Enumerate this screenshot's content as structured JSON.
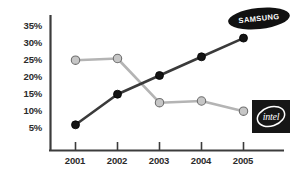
{
  "chart_data": {
    "type": "line",
    "title": "",
    "subtitle": "",
    "xlabel": "",
    "ylabel": "",
    "categories": [
      "2001",
      "2002",
      "2003",
      "2004",
      "2005"
    ],
    "x": [
      2001,
      2002,
      2003,
      2004,
      2005
    ],
    "ylim": [
      0,
      37
    ],
    "xlim": [
      2000.6,
      2005.4
    ],
    "grid": false,
    "legend_position": "inline-labels",
    "y_tick_labels": [
      "35%",
      "30%",
      "25%",
      "20%",
      "15%",
      "10%",
      "5%"
    ],
    "y_tick_values": [
      35,
      30,
      25,
      20,
      15,
      10,
      5
    ],
    "x_tick_labels": [
      "2001",
      "2002",
      "2003",
      "2004",
      "2005"
    ],
    "series": [
      {
        "name": "SAMSUNG",
        "color": "#3a3a3a",
        "marker": "filled-circle",
        "marker_color": "#141414",
        "values": [
          5.5,
          14.5,
          20.0,
          25.5,
          31.0
        ]
      },
      {
        "name": "intel",
        "color": "#b4b4b4",
        "marker": "open-circle",
        "marker_color": "#c6c6c6",
        "values": [
          24.5,
          25.0,
          12.0,
          12.5,
          9.5
        ]
      }
    ],
    "annotations": [
      {
        "name": "samsung-logo",
        "text": "SAMSUNG",
        "series": "SAMSUNG"
      },
      {
        "name": "intel-logo",
        "text": "intel",
        "series": "intel"
      }
    ]
  },
  "axes": {
    "axis_color": "#3c3c3c",
    "y_ticks": [
      {
        "label": "35%",
        "value": 35
      },
      {
        "label": "30%",
        "value": 30
      },
      {
        "label": "25%",
        "value": 25
      },
      {
        "label": "20%",
        "value": 20
      },
      {
        "label": "15%",
        "value": 15
      },
      {
        "label": "10%",
        "value": 10
      },
      {
        "label": "5%",
        "value": 5
      }
    ],
    "x_ticks": [
      {
        "label": "2001"
      },
      {
        "label": "2002"
      },
      {
        "label": "2003"
      },
      {
        "label": "2004"
      },
      {
        "label": "2005"
      }
    ]
  },
  "logos": {
    "samsung": {
      "text": "SAMSUNG",
      "bg": "#111111",
      "fg": "#ffffff"
    },
    "intel": {
      "text": "intel",
      "bg": "#161616",
      "fg": "#ffffff"
    }
  },
  "colors": {
    "background": "#ffffff",
    "samsung_line": "#3a3a3a",
    "intel_line": "#b4b4b4",
    "text": "#2b2b2b"
  }
}
